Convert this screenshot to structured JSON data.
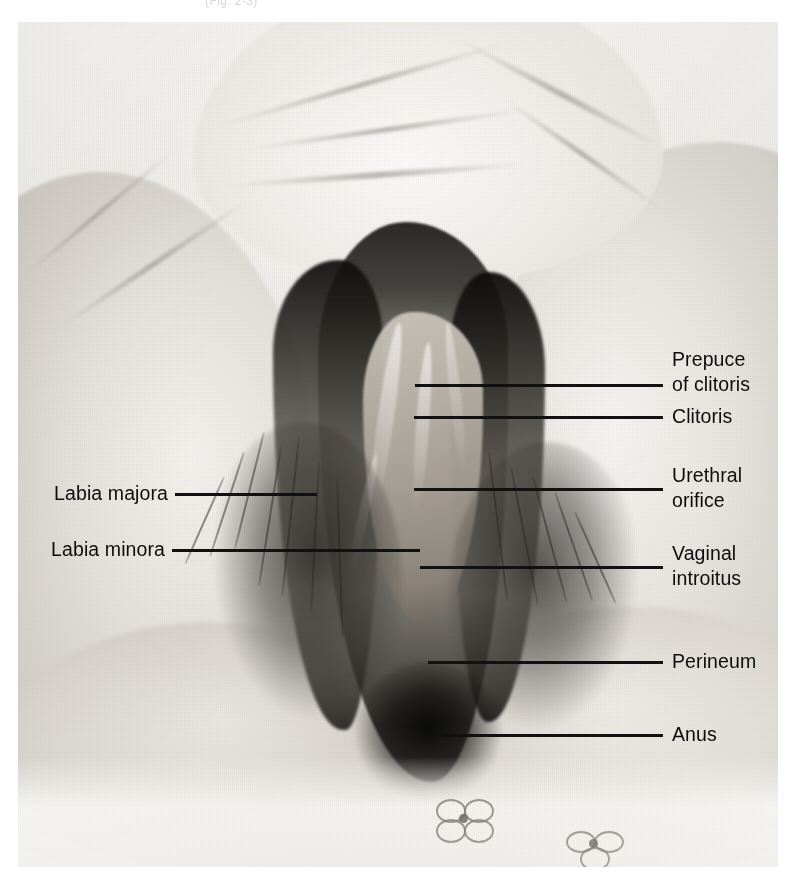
{
  "figure": {
    "type": "anatomical-photograph",
    "orientation": "lithotomy / frontal view",
    "rendering": "black-and-white halftone photograph",
    "header_fragment": "(Fig. 2-3)"
  },
  "labels": {
    "left": [
      {
        "id": "labia-majora",
        "text": "Labia majora"
      },
      {
        "id": "labia-minora",
        "text": "Labia minora"
      }
    ],
    "right": [
      {
        "id": "prepuce-of-clitoris",
        "line1": "Prepuce",
        "line2": "of clitoris",
        "text": "Prepuce of clitoris"
      },
      {
        "id": "clitoris",
        "line1": "Clitoris",
        "line2": "",
        "text": "Clitoris"
      },
      {
        "id": "urethral-orifice",
        "line1": "Urethral",
        "line2": "orifice",
        "text": "Urethral orifice"
      },
      {
        "id": "vaginal-introitus",
        "line1": "Vaginal",
        "line2": "introitus",
        "text": "Vaginal introitus"
      },
      {
        "id": "perineum",
        "line1": "Perineum",
        "line2": "",
        "text": "Perineum"
      },
      {
        "id": "anus",
        "line1": "Anus",
        "line2": "",
        "text": "Anus"
      }
    ]
  },
  "colors": {
    "leader_line": "#111111",
    "label_text": "#0d0d0d",
    "page_background": "#ffffff",
    "photo_light": "#f4f2ee",
    "photo_mid": "#a9a39a",
    "photo_dark": "#141210"
  }
}
